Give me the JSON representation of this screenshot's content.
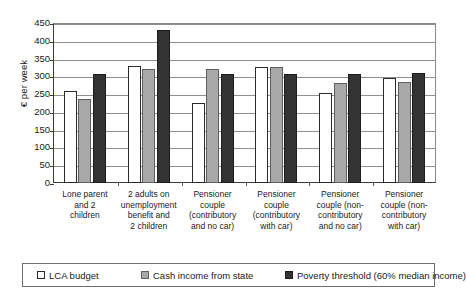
{
  "chart_data": {
    "type": "bar",
    "title": "",
    "xlabel": "",
    "ylabel": "€ per week",
    "ylim": [
      0,
      450
    ],
    "yticks": [
      0,
      50,
      100,
      150,
      200,
      250,
      300,
      350,
      400,
      450
    ],
    "grid": true,
    "legend_position": "bottom",
    "categories": [
      "Lone parent and 2 children",
      "2 adults on unemployment benefit and 2 children",
      "Pensioner couple (contributory and no car)",
      "Pensioner couple (contributory with car)",
      "Pensioner couple (non-contributory and no car)",
      "Pensioner couple (non-contributory with car)"
    ],
    "category_lines": [
      [
        "Lone parent",
        "and 2",
        "children"
      ],
      [
        "2 adults on",
        "unemployment",
        "benefit and",
        "2 children"
      ],
      [
        "Pensioner",
        "couple",
        "(contributory",
        "and no car)"
      ],
      [
        "Pensioner",
        "couple",
        "(contributory",
        "with car)"
      ],
      [
        "Pensioner",
        "couple (non-",
        "contributory",
        "and no car)"
      ],
      [
        "Pensioner",
        "couple (non-",
        "contributory",
        "with car)"
      ]
    ],
    "series": [
      {
        "name": "LCA budget",
        "key": "lca",
        "color": "#ffffff",
        "values": [
          260,
          330,
          226,
          325,
          252,
          294
        ]
      },
      {
        "name": "Cash income from state",
        "key": "cash",
        "color": "#a8a8a8",
        "values": [
          237,
          320,
          320,
          327,
          282,
          284
        ]
      },
      {
        "name": "Poverty threshold (60% median income)",
        "key": "poverty",
        "color": "#333333",
        "values": [
          307,
          430,
          307,
          307,
          307,
          310
        ]
      }
    ]
  },
  "legend": {
    "items": [
      {
        "label": "LCA budget",
        "key": "lca"
      },
      {
        "label": "Cash income from state",
        "key": "cash"
      },
      {
        "label": "Poverty threshold (60% median income)",
        "key": "poverty"
      }
    ]
  }
}
